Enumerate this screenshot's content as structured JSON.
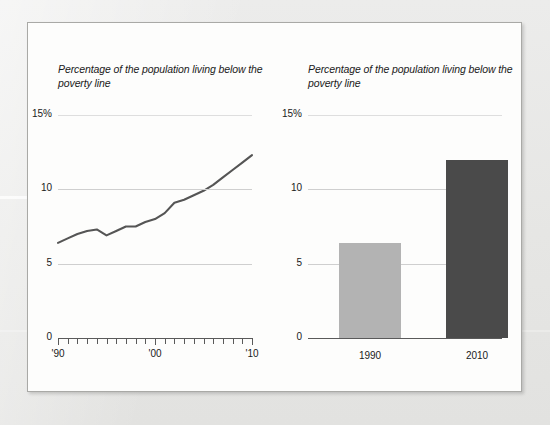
{
  "panel": {
    "background": "#fdfdfc",
    "border_color": "#a9a9a6"
  },
  "chart_data": [
    {
      "id": "poverty-line-trend",
      "type": "line",
      "title": "Percentage of the population living below the poverty line",
      "xlabel": "",
      "ylabel": "",
      "ylim": [
        0,
        15
      ],
      "xlim": [
        1990,
        2010
      ],
      "yticks": [
        "0",
        "5",
        "10",
        "15%"
      ],
      "ytick_values": [
        0,
        5,
        10,
        15
      ],
      "xticks": [
        "'90",
        "'00",
        "'10"
      ],
      "xtick_values": [
        1990,
        2000,
        2010
      ],
      "grid": true,
      "legend": "none",
      "line_color": "#555555",
      "x": [
        1990,
        1991,
        1992,
        1993,
        1994,
        1995,
        1996,
        1997,
        1998,
        1999,
        2000,
        2001,
        2002,
        2003,
        2004,
        2005,
        2006,
        2007,
        2008,
        2009,
        2010
      ],
      "values": [
        6.4,
        6.7,
        7.0,
        7.2,
        7.3,
        6.9,
        7.2,
        7.5,
        7.5,
        7.8,
        8.0,
        8.4,
        9.1,
        9.3,
        9.6,
        9.9,
        10.3,
        10.8,
        11.3,
        11.8,
        12.3
      ]
    },
    {
      "id": "poverty-line-compare",
      "type": "bar",
      "title": "Percentage of the population living below the poverty line",
      "xlabel": "",
      "ylabel": "",
      "ylim": [
        0,
        15
      ],
      "yticks": [
        "0",
        "5",
        "10",
        "15%"
      ],
      "ytick_values": [
        0,
        5,
        10,
        15
      ],
      "grid": true,
      "legend": "none",
      "categories": [
        "1990",
        "2010"
      ],
      "values": [
        6.4,
        12.0
      ],
      "colors": [
        "#b3b3b3",
        "#4a4a4a"
      ]
    }
  ]
}
